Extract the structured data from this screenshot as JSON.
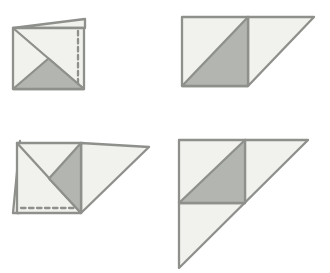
{
  "canvas": {
    "width": 330,
    "height": 273,
    "background": "#ffffff"
  },
  "palette": {
    "paper_light": "#f1f1ee",
    "paper_shaded": "#b3b5b1",
    "stroke": "#8e908c",
    "stroke_width": 2.3,
    "dash_pattern": "4.5 3.5"
  },
  "figures": [
    {
      "name": "figure-top-left-folded-square",
      "shapes": [
        {
          "name": "top-flap-sliver",
          "type": "polygon",
          "points": [
            [
              13,
              28
            ],
            [
              85,
              19
            ],
            [
              85,
              28
            ]
          ],
          "fill": "paper_light"
        },
        {
          "name": "paper-square",
          "type": "polygon",
          "points": [
            [
              13,
              28
            ],
            [
              84,
              28
            ],
            [
              84,
              89
            ],
            [
              13,
              89
            ]
          ],
          "fill": "paper_light"
        },
        {
          "name": "diagonal-crease-line",
          "type": "line",
          "points": [
            [
              13,
              28
            ],
            [
              84,
              89
            ]
          ]
        },
        {
          "name": "shaded-bottom-triangle",
          "type": "polygon",
          "points": [
            [
              48.5,
              58.5
            ],
            [
              13,
              89
            ],
            [
              84,
              89
            ]
          ],
          "fill": "paper_shaded"
        },
        {
          "name": "dashed-fold-line-vertical",
          "type": "line",
          "points": [
            [
              78,
              31
            ],
            [
              78,
              86
            ]
          ],
          "dashed": true
        }
      ]
    },
    {
      "name": "figure-top-right-half-unfolded",
      "shapes": [
        {
          "name": "unfolded-right-flap-triangle",
          "type": "polygon",
          "points": [
            [
              248,
              17
            ],
            [
              314,
              17
            ],
            [
              248,
              86
            ]
          ],
          "fill": "paper_light"
        },
        {
          "name": "paper-square",
          "type": "polygon",
          "points": [
            [
              182,
              17
            ],
            [
              248,
              17
            ],
            [
              248,
              86
            ],
            [
              182,
              86
            ]
          ],
          "fill": "paper_light"
        },
        {
          "name": "shaded-lower-right-triangle",
          "type": "polygon",
          "points": [
            [
              182,
              86
            ],
            [
              248,
              17
            ],
            [
              248,
              86
            ]
          ],
          "fill": "paper_shaded"
        }
      ]
    },
    {
      "name": "figure-bottom-left-folded-square",
      "shapes": [
        {
          "name": "left-flap-sliver",
          "type": "polygon",
          "points": [
            [
              20,
              141
            ],
            [
              13,
              213
            ],
            [
              19,
              213
            ]
          ],
          "fill": "paper_light"
        },
        {
          "name": "unfolded-right-flap-triangle",
          "type": "polygon",
          "points": [
            [
              81,
              143
            ],
            [
              149,
              147
            ],
            [
              81,
              213
            ]
          ],
          "fill": "paper_light"
        },
        {
          "name": "paper-square",
          "type": "polygon",
          "points": [
            [
              17,
              143
            ],
            [
              81,
              143
            ],
            [
              81,
              213
            ],
            [
              17,
              213
            ]
          ],
          "fill": "paper_light"
        },
        {
          "name": "diagonal-crease-line",
          "type": "line",
          "points": [
            [
              17,
              143
            ],
            [
              81,
              213
            ]
          ]
        },
        {
          "name": "shaded-right-triangle",
          "type": "polygon",
          "points": [
            [
              81,
              143
            ],
            [
              49,
              178.5
            ],
            [
              81,
              213
            ]
          ],
          "fill": "paper_shaded"
        },
        {
          "name": "dashed-fold-line-horizontal",
          "type": "line",
          "points": [
            [
              21,
              208
            ],
            [
              77,
              208
            ]
          ],
          "dashed": true
        }
      ]
    },
    {
      "name": "figure-bottom-right-fully-unfolded",
      "shapes": [
        {
          "name": "large-right-triangle-sheet",
          "type": "polygon",
          "points": [
            [
              179,
              140
            ],
            [
              308,
              140
            ],
            [
              179,
              268
            ]
          ],
          "fill": "paper_light"
        },
        {
          "name": "vertical-crease-line",
          "type": "line",
          "points": [
            [
              245,
              140
            ],
            [
              245,
              203
            ]
          ]
        },
        {
          "name": "horizontal-crease-line",
          "type": "line",
          "points": [
            [
              179,
              203
            ],
            [
              245,
              203
            ]
          ]
        },
        {
          "name": "shaded-center-triangle",
          "type": "polygon",
          "points": [
            [
              245,
              140
            ],
            [
              179,
              203
            ],
            [
              245,
              203
            ]
          ],
          "fill": "paper_shaded"
        }
      ]
    }
  ]
}
